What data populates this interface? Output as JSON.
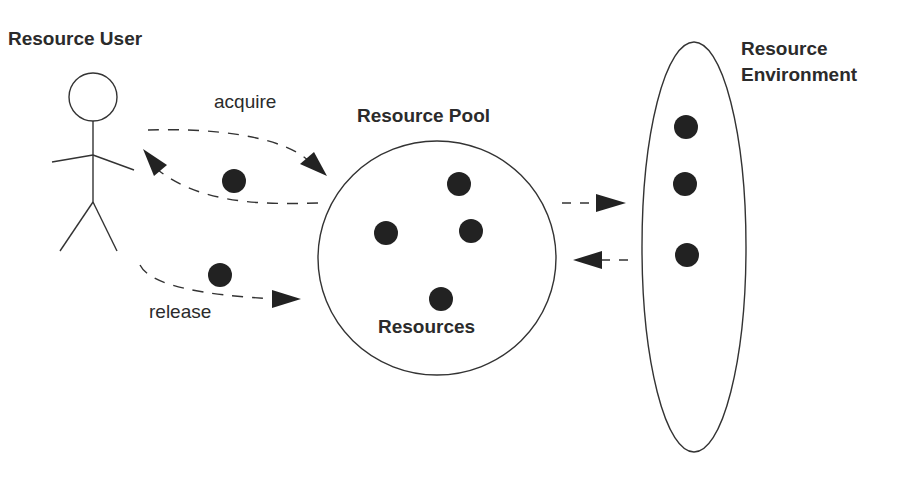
{
  "diagram": {
    "type": "resource-pool-pattern",
    "colors": {
      "stroke": "#333333",
      "dot": "#222222",
      "text": "#2b2b2b",
      "background": "#ffffff"
    },
    "actor": {
      "label": "Resource User",
      "icon": "stick-figure-icon"
    },
    "flows": {
      "acquire_label": "acquire",
      "release_label": "release"
    },
    "pool": {
      "title": "Resource Pool",
      "contents_label": "Resources",
      "resource_count": 4
    },
    "environment": {
      "title_line1": "Resource",
      "title_line2": "Environment",
      "resource_count": 3
    },
    "connections": [
      {
        "from": "Resource Pool",
        "to": "Resource User",
        "label": "acquire",
        "style": "dashed"
      },
      {
        "from": "Resource User",
        "to": "Resource Pool",
        "label": "release",
        "style": "dashed"
      },
      {
        "from": "Resource Pool",
        "to": "Resource Environment",
        "style": "dashed"
      },
      {
        "from": "Resource Environment",
        "to": "Resource Pool",
        "style": "dashed"
      }
    ]
  }
}
